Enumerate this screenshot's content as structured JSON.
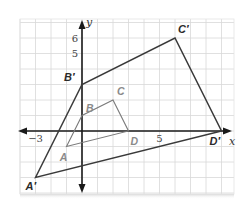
{
  "diagram": {
    "type": "coordinate-plane-dilation",
    "axes": {
      "x_label": "x",
      "y_label": "y",
      "x_tick_labels": [
        {
          "value": -3,
          "text": "−3"
        },
        {
          "value": 5,
          "text": "5"
        }
      ],
      "y_tick_labels": [
        {
          "value": 5,
          "text": "5"
        },
        {
          "value": 6,
          "text": "6"
        }
      ]
    },
    "grid": {
      "origin_px": [
        82,
        131
      ],
      "unit_px": 15.5,
      "x_range": [
        -4,
        10
      ],
      "y_range": [
        -4,
        7
      ],
      "line_color": "#d8d8d8",
      "axis_color": "#1a1a1a"
    },
    "original": {
      "name": "ABCD",
      "color": "#7a7a7a",
      "label_color": "#8a8a8a",
      "vertices": [
        {
          "label": "A",
          "x": -1,
          "y": -1
        },
        {
          "label": "B",
          "x": 0,
          "y": 1
        },
        {
          "label": "C",
          "x": 2,
          "y": 2
        },
        {
          "label": "D",
          "x": 3,
          "y": 0
        }
      ]
    },
    "image": {
      "name": "A'B'C'D'",
      "color": "#3a3a3a",
      "label_color": "#2a2a2a",
      "vertices": [
        {
          "label": "A′",
          "x": -3,
          "y": -3
        },
        {
          "label": "B′",
          "x": 0,
          "y": 3
        },
        {
          "label": "C′",
          "x": 6,
          "y": 6
        },
        {
          "label": "D′",
          "x": 9,
          "y": 0
        }
      ]
    }
  }
}
